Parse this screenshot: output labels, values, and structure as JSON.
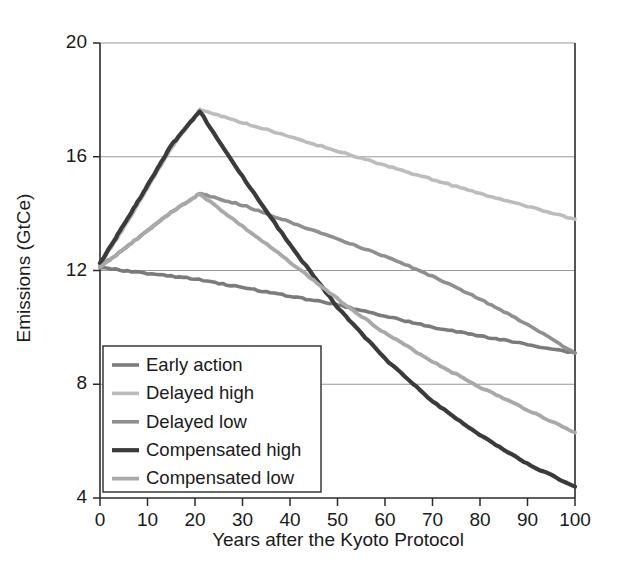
{
  "chart_data": {
    "type": "line",
    "title": "",
    "xlabel": "Years after the Kyoto Protocol",
    "ylabel": "Emissions (GtCe)",
    "xlim": [
      0,
      100
    ],
    "ylim": [
      4,
      20
    ],
    "xticks": [
      0,
      10,
      20,
      30,
      40,
      50,
      60,
      70,
      80,
      90,
      100
    ],
    "yticks": [
      4,
      8,
      12,
      16,
      20
    ],
    "xtick_labels": [
      "0",
      "10",
      "20",
      "30",
      "40",
      "50",
      "60",
      "70",
      "80",
      "90",
      "100"
    ],
    "ytick_labels": [
      "4",
      "8",
      "12",
      "16",
      "20"
    ],
    "grid": "horizontal",
    "legend_position": "lower-left-inside",
    "series": [
      {
        "name": "Early action",
        "color": "#7b7b7b",
        "width": 3.6,
        "x": [
          0,
          10,
          20,
          30,
          40,
          50,
          60,
          70,
          80,
          90,
          100
        ],
        "values": [
          12.1,
          11.9,
          11.7,
          11.4,
          11.1,
          10.8,
          10.4,
          10.0,
          9.7,
          9.4,
          9.1
        ]
      },
      {
        "name": "Delayed high",
        "color": "#bcbcbc",
        "width": 3.6,
        "x": [
          0,
          5,
          10,
          15,
          21,
          30,
          40,
          50,
          60,
          70,
          80,
          90,
          100
        ],
        "values": [
          12.2,
          13.5,
          14.9,
          16.3,
          17.65,
          17.2,
          16.7,
          16.2,
          15.7,
          15.2,
          14.7,
          14.25,
          13.8
        ]
      },
      {
        "name": "Delayed low",
        "color": "#8f8f8f",
        "width": 3.6,
        "x": [
          0,
          5,
          10,
          15,
          21,
          30,
          40,
          50,
          60,
          70,
          80,
          90,
          100
        ],
        "values": [
          12.15,
          12.75,
          13.4,
          14.05,
          14.7,
          14.3,
          13.7,
          13.1,
          12.5,
          11.8,
          11.0,
          10.1,
          9.1
        ]
      },
      {
        "name": "Compensated high",
        "color": "#3b3b3b",
        "width": 4.2,
        "x": [
          0,
          5,
          10,
          15,
          21,
          30,
          40,
          50,
          60,
          70,
          80,
          90,
          100
        ],
        "values": [
          12.25,
          13.6,
          15.0,
          16.4,
          17.6,
          15.3,
          12.9,
          10.7,
          8.9,
          7.4,
          6.2,
          5.2,
          4.4
        ]
      },
      {
        "name": "Compensated low",
        "color": "#a9a9a9",
        "width": 3.8,
        "x": [
          0,
          5,
          10,
          15,
          21,
          30,
          40,
          50,
          60,
          70,
          80,
          90,
          100
        ],
        "values": [
          12.1,
          12.75,
          13.4,
          14.05,
          14.7,
          13.55,
          12.3,
          11.0,
          9.8,
          8.8,
          7.9,
          7.1,
          6.3
        ]
      }
    ]
  },
  "legend": {
    "items": [
      {
        "label": "Early action"
      },
      {
        "label": "Delayed high"
      },
      {
        "label": "Delayed low"
      },
      {
        "label": "Compensated high"
      },
      {
        "label": "Compensated low"
      }
    ]
  }
}
